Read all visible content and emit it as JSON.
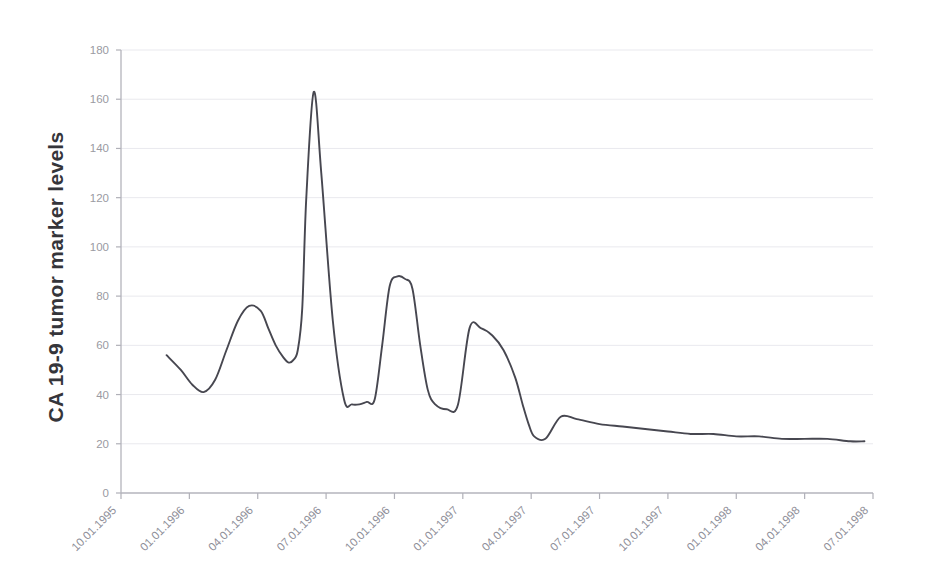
{
  "chart_data": {
    "type": "line",
    "title": "",
    "xlabel": "",
    "ylabel": "CA 19-9 tumor marker levels",
    "ylim": [
      0,
      180
    ],
    "ytick_step": 20,
    "yticks": [
      0,
      20,
      40,
      60,
      80,
      100,
      120,
      140,
      160,
      180
    ],
    "grid": true,
    "legend": "none",
    "xticks": [
      "10.01.1995",
      "01.01.1996",
      "04.01.1996",
      "07.01.1996",
      "10.01.1996",
      "01.01.1997",
      "04.01.1997",
      "07.01.1997",
      "10.01.1997",
      "01.01.1998",
      "04.01.1998",
      "07.01.1998"
    ],
    "xtick_rotation_deg": 45,
    "series": [
      {
        "name": "CA 19-9",
        "x": [
          "12.01.1995",
          "12.20.1995",
          "01.05.1996",
          "01.20.1996",
          "02.05.1996",
          "02.20.1996",
          "03.05.1996",
          "03.20.1996",
          "04.05.1996",
          "04.15.1996",
          "04.25.1996",
          "05.05.1996",
          "05.12.1996",
          "05.18.1996",
          "05.24.1996",
          "05.30.1996",
          "06.05.1996",
          "06.15.1996",
          "06.25.1996",
          "07.10.1996",
          "07.25.1996",
          "08.05.1996",
          "08.15.1996",
          "08.25.1996",
          "09.05.1996",
          "09.15.1996",
          "09.25.1996",
          "10.05.1996",
          "10.15.1996",
          "10.25.1996",
          "11.05.1996",
          "11.15.1996",
          "11.25.1996",
          "12.10.1996",
          "12.25.1996",
          "01.10.1997",
          "01.25.1997",
          "02.10.1997",
          "02.25.1997",
          "03.10.1997",
          "03.20.1997",
          "03.28.1997",
          "04.05.1997",
          "04.20.1997",
          "05.10.1997",
          "06.01.1997",
          "07.01.1997",
          "08.01.1997",
          "09.01.1997",
          "10.01.1997",
          "11.01.1997",
          "12.01.1997",
          "01.01.1998",
          "02.01.1998",
          "03.01.1998",
          "04.01.1998",
          "05.01.1998",
          "06.01.1998",
          "06.20.1998"
        ],
        "y": [
          56,
          50,
          44,
          41,
          46,
          58,
          70,
          76,
          74,
          67,
          60,
          55,
          53,
          54,
          58,
          75,
          120,
          163,
          130,
          70,
          38,
          36,
          36,
          37,
          38,
          60,
          84,
          88,
          87,
          83,
          60,
          42,
          36,
          34,
          36,
          67,
          67,
          64,
          58,
          47,
          36,
          28,
          23,
          22,
          31,
          30,
          28,
          27,
          26,
          25,
          24,
          24,
          23,
          23,
          22,
          22,
          22,
          21,
          21
        ],
        "color": "#474750",
        "peak_value": 163,
        "start_value": 56,
        "end_value": 21,
        "min_value": 21
      }
    ],
    "annotations": []
  },
  "axis": {
    "y_title": "CA 19-9 tumor marker levels"
  },
  "colors": {
    "line": "#474750",
    "grid": "#e9e9ee",
    "axis": "#b4b4bc",
    "tick_text": "#9a9aa2",
    "title_text": "#35353a",
    "background": "#ffffff"
  }
}
